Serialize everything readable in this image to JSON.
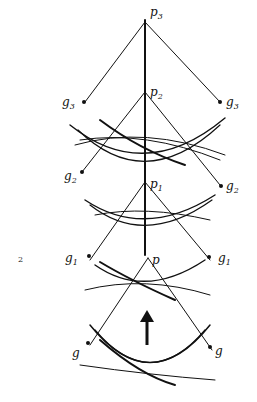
{
  "figure": {
    "number": "2",
    "labels": {
      "p3": {
        "base": "p",
        "sub": "3"
      },
      "p2": {
        "base": "p",
        "sub": "2"
      },
      "p1": {
        "base": "p",
        "sub": "1"
      },
      "p": {
        "base": "p",
        "sub": ""
      },
      "g3_left": {
        "base": "g",
        "sub": "3"
      },
      "g3_right": {
        "base": "g",
        "sub": "3"
      },
      "g2_left": {
        "base": "g",
        "sub": "2"
      },
      "g2_right": {
        "base": "g",
        "sub": "2"
      },
      "g1_left": {
        "base": "g",
        "sub": "1"
      },
      "g1_right": {
        "base": "g",
        "sub": "1"
      },
      "g_left": {
        "base": "g",
        "sub": ""
      },
      "g_right": {
        "base": "g",
        "sub": ""
      }
    },
    "arrow": "up-arrow",
    "colors": {
      "ink": "#111111",
      "background": "#ffffff"
    }
  }
}
